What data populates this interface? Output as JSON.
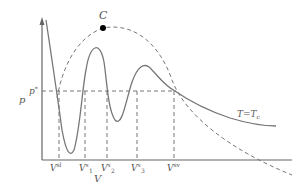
{
  "diagram": {
    "type": "pV isotherm with multiple phase coexistence",
    "axes": {
      "x_label": "V",
      "y_label": "p"
    },
    "critical_point_label": "C",
    "pressure_level_label": "p*",
    "isotherm_label": "T=Tc",
    "volume_markers": [
      {
        "base": "V",
        "sup": "sl",
        "sub": ""
      },
      {
        "base": "V",
        "sup": "x",
        "sub": "1"
      },
      {
        "base": "V",
        "sup": "x",
        "sub": "2"
      },
      {
        "base": "V",
        "sup": "x",
        "sub": "3"
      },
      {
        "base": "V",
        "sup": "sv",
        "sub": ""
      }
    ],
    "colors": {
      "curve": "#777777",
      "axis": "#666666",
      "dash": "#777777",
      "point": "#000000"
    }
  }
}
